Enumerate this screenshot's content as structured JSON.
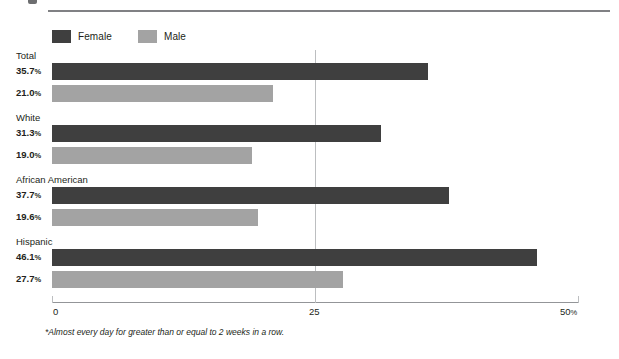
{
  "figure": {
    "top_marker": "bullet-marker",
    "footnote": "*Almost every day for greater than or equal to 2 weeks in a row."
  },
  "legend": {
    "items": [
      {
        "label": "Female",
        "color": "#3f3f3f",
        "key": "female"
      },
      {
        "label": "Male",
        "color": "#a3a3a3",
        "key": "male"
      }
    ]
  },
  "axis": {
    "ticks": [
      {
        "label": "0",
        "unit": "",
        "value": 0
      },
      {
        "label": "25",
        "unit": "",
        "value": 25
      },
      {
        "label": "50",
        "unit": "%",
        "value": 50
      }
    ],
    "min": 0,
    "max": 50
  },
  "groups": [
    {
      "title": "Total",
      "bars": [
        {
          "series": "Female",
          "value": 35.7,
          "value_label": "35.7",
          "unit": "%"
        },
        {
          "series": "Male",
          "value": 21.0,
          "value_label": "21.0",
          "unit": "%"
        }
      ]
    },
    {
      "title": "White",
      "bars": [
        {
          "series": "Female",
          "value": 31.3,
          "value_label": "31.3",
          "unit": "%"
        },
        {
          "series": "Male",
          "value": 19.0,
          "value_label": "19.0",
          "unit": "%"
        }
      ]
    },
    {
      "title": "African American",
      "bars": [
        {
          "series": "Female",
          "value": 37.7,
          "value_label": "37.7",
          "unit": "%"
        },
        {
          "series": "Male",
          "value": 19.6,
          "value_label": "19.6",
          "unit": "%"
        }
      ]
    },
    {
      "title": "Hispanic",
      "bars": [
        {
          "series": "Female",
          "value": 46.1,
          "value_label": "46.1",
          "unit": "%"
        },
        {
          "series": "Male",
          "value": 27.7,
          "value_label": "27.7",
          "unit": "%"
        }
      ]
    }
  ],
  "chart_data": {
    "type": "bar",
    "orientation": "horizontal",
    "title": "",
    "subtitle": "",
    "xlabel": "",
    "ylabel": "",
    "categories": [
      "Total",
      "White",
      "African American",
      "Hispanic"
    ],
    "series": [
      {
        "name": "Female",
        "color": "#3f3f3f",
        "values": [
          35.7,
          31.3,
          37.7,
          46.1
        ]
      },
      {
        "name": "Male",
        "color": "#a3a3a3",
        "values": [
          21.0,
          19.0,
          19.6,
          27.7
        ]
      }
    ],
    "xlim": [
      0,
      50
    ],
    "xticks": [
      0,
      25,
      50
    ],
    "xtick_labels": [
      "0",
      "25",
      "50%"
    ],
    "grid": "vertical-at-25",
    "legend_position": "top-left",
    "annotations": [
      "*Almost every day for greater than or equal to 2 weeks in a row."
    ],
    "value_labels": [
      "35.7%",
      "21.0%",
      "31.3%",
      "19.0%",
      "37.7%",
      "19.6%",
      "46.1%",
      "27.7%"
    ]
  }
}
